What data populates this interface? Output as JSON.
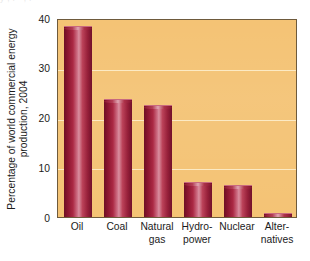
{
  "figure": {
    "caption_remnant": "y   ,  .  -  ,   .",
    "background_color": "#ffffff"
  },
  "chart_data": {
    "type": "bar",
    "title": "",
    "subtitle": "",
    "xlabel": "",
    "ylabel": "Percentage of world commercial energy production, 2004",
    "ylabel_line1": "Percentage of world commercial energy",
    "ylabel_line2": "production, 2004",
    "categories": [
      "Oil",
      "Coal",
      "Natural gas",
      "Hydro-power",
      "Nuclear",
      "Alternatives"
    ],
    "category_lines": [
      [
        "Oil",
        ""
      ],
      [
        "Coal",
        ""
      ],
      [
        "Natural",
        "gas"
      ],
      [
        "Hydro-",
        "power"
      ],
      [
        "Nuclear",
        ""
      ],
      [
        "Alter-",
        "natives"
      ]
    ],
    "values": [
      38.3,
      23.7,
      22.5,
      7.1,
      6.5,
      0.8
    ],
    "ylim": [
      0,
      40
    ],
    "yticks": [
      0,
      10,
      20,
      30,
      40
    ],
    "ytick_labels": [
      "0",
      "10",
      "20",
      "30",
      "40"
    ],
    "grid": true,
    "grid_axis": "y",
    "legend": false,
    "legend_position": "none",
    "plot_background_color": "#f4c375",
    "bar_color_dark": "#6d0f24",
    "bar_color_mid": "#ab2944",
    "bar_color_light": "#d98fa0",
    "gridline_color": "#fff8e1",
    "axis_color": "#3a3a3a",
    "text_color": "#1b1b1b"
  }
}
